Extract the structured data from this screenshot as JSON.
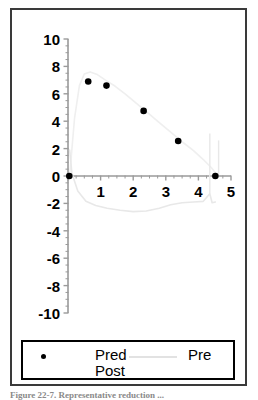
{
  "figure": {
    "caption": "Figure 22-7. Representative reduction ..."
  },
  "legend": {
    "marker_dot_name": "filled-circle-marker",
    "marker_line_name": "gray-line-marker",
    "series_labels": "Pred\nPost",
    "series_label_line1": "Pred",
    "series_label_line2": "Post",
    "line_label": "Pre",
    "border_color": "#000000",
    "dot_color": "#000000",
    "line_color": "#e2e2e2"
  },
  "colors": {
    "frame": "#3a3a3a",
    "axis": "#9a9a9a",
    "marker": "#000000",
    "curve_pre": "#e8e8e8",
    "curve_post": "#efefef"
  },
  "chart_data": {
    "type": "scatter",
    "title": "",
    "xlabel": "",
    "ylabel": "",
    "xlim": [
      0,
      5
    ],
    "ylim": [
      -10,
      10
    ],
    "grid": false,
    "legend_position": "below-plot",
    "xticks": [
      0,
      1,
      2,
      3,
      4,
      5
    ],
    "xtick_labels": [
      "",
      "1",
      "2",
      "3",
      "4",
      "5"
    ],
    "yticks": [
      -10,
      -8,
      -6,
      -4,
      -2,
      0,
      2,
      4,
      6,
      8,
      10
    ],
    "ytick_labels": [
      "-10",
      "-8",
      "-6",
      "-4",
      "-2",
      "0",
      "2",
      "4",
      "6",
      "8",
      "10"
    ],
    "x_minor_tick_step": 0.25,
    "y_minor_tick_step": 0.5,
    "series": [
      {
        "name": "Pred Post",
        "type": "scatter",
        "marker": "filled-circle",
        "color": "#000000",
        "points": [
          {
            "x": 0.04,
            "y": 0.0
          },
          {
            "x": 0.62,
            "y": 6.9
          },
          {
            "x": 1.18,
            "y": 6.6
          },
          {
            "x": 2.32,
            "y": 4.75
          },
          {
            "x": 3.38,
            "y": 2.55
          },
          {
            "x": 4.52,
            "y": 0.0
          }
        ]
      },
      {
        "name": "Post curve",
        "type": "line",
        "color": "#efefef",
        "points": [
          {
            "x": 0.06,
            "y": 0.3
          },
          {
            "x": 0.2,
            "y": 4.2
          },
          {
            "x": 0.35,
            "y": 6.6
          },
          {
            "x": 0.5,
            "y": 7.45
          },
          {
            "x": 0.68,
            "y": 7.6
          },
          {
            "x": 0.9,
            "y": 7.4
          },
          {
            "x": 1.15,
            "y": 7.0
          },
          {
            "x": 1.45,
            "y": 6.55
          },
          {
            "x": 1.75,
            "y": 6.0
          },
          {
            "x": 2.1,
            "y": 5.3
          },
          {
            "x": 2.45,
            "y": 4.6
          },
          {
            "x": 2.8,
            "y": 3.9
          },
          {
            "x": 3.15,
            "y": 3.2
          },
          {
            "x": 3.5,
            "y": 2.5
          },
          {
            "x": 3.85,
            "y": 1.85
          },
          {
            "x": 4.15,
            "y": 1.2
          },
          {
            "x": 4.4,
            "y": 0.6
          },
          {
            "x": 4.58,
            "y": 0.05
          }
        ]
      },
      {
        "name": "Pre",
        "type": "line",
        "color": "#e8e8e8",
        "points": [
          {
            "x": 0.05,
            "y": 1.9
          },
          {
            "x": 0.12,
            "y": 0.2
          },
          {
            "x": 0.3,
            "y": -1.1
          },
          {
            "x": 0.55,
            "y": -1.85
          },
          {
            "x": 0.85,
            "y": -2.15
          },
          {
            "x": 1.2,
            "y": -2.35
          },
          {
            "x": 1.6,
            "y": -2.5
          },
          {
            "x": 2.0,
            "y": -2.6
          },
          {
            "x": 2.4,
            "y": -2.55
          },
          {
            "x": 2.8,
            "y": -2.35
          },
          {
            "x": 3.15,
            "y": -2.1
          },
          {
            "x": 3.5,
            "y": -1.95
          },
          {
            "x": 3.85,
            "y": -1.9
          },
          {
            "x": 4.15,
            "y": -1.85
          },
          {
            "x": 4.35,
            "y": -1.3
          },
          {
            "x": 4.42,
            "y": -1.95
          },
          {
            "x": 4.52,
            "y": -1.9
          }
        ]
      }
    ],
    "annotations": [
      {
        "name": "pre-vertical-tail",
        "x": 4.35,
        "y_from": 3.1,
        "y_to": -1.3
      },
      {
        "name": "post-vertical-tail",
        "x": 4.62,
        "y_from": 2.6,
        "y_to": 0.1
      }
    ]
  }
}
